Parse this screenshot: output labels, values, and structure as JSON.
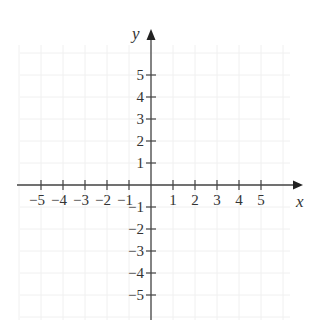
{
  "diagram": {
    "type": "coordinate-plane",
    "x_axis": {
      "label": "x",
      "ticks": [
        -5,
        -4,
        -3,
        -2,
        -1,
        1,
        2,
        3,
        4,
        5
      ],
      "tick_labels": [
        "−5",
        "−4",
        "−3",
        "−2",
        "−1",
        "1",
        "2",
        "3",
        "4",
        "5"
      ]
    },
    "y_axis": {
      "label": "y",
      "ticks": [
        5,
        4,
        3,
        2,
        1,
        -1,
        -2,
        -3,
        -4,
        -5
      ],
      "tick_labels": [
        "5",
        "4",
        "3",
        "2",
        "1",
        "−1",
        "−2",
        "−3",
        "−4",
        "−5"
      ]
    },
    "grid": true,
    "colors": {
      "axis": "#444444",
      "grid": "#f0f0f0",
      "text": "#333333"
    }
  }
}
